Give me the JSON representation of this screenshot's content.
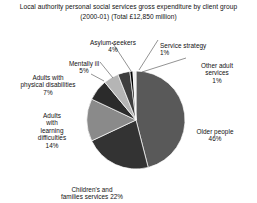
{
  "chart_data": {
    "type": "pie",
    "title": "Local authority personal social services gross expenditure by client group",
    "subtitle": "(2000-01) (Total £12,850 million)",
    "units": "percent of total gross expenditure",
    "total_label": "Total £12,850 million",
    "period": "2000-01",
    "legend": "none",
    "grid": false,
    "start_angle_deg": -90,
    "direction": "clockwise",
    "categories": [
      "Older people",
      "Children's and families services",
      "Adults with learning difficulties",
      "Adults with physical disabilities",
      "Mentally ill",
      "Asylum-seekers",
      "Service strategy",
      "Other adult services"
    ],
    "values": [
      46,
      22,
      14,
      7,
      5,
      4,
      1,
      1
    ],
    "slices": [
      {
        "label": "Older people",
        "value": 46,
        "pct_text": "46%",
        "color": "#595959"
      },
      {
        "label": "Children's and families services",
        "value": 22,
        "pct_text": "22%",
        "color": "#333333"
      },
      {
        "label": "Adults with learning difficulties",
        "value": 14,
        "pct_text": "14%",
        "color": "#8a8a8a"
      },
      {
        "label": "Adults with physical disabilities",
        "value": 7,
        "pct_text": "7%",
        "color": "#2b2b2b"
      },
      {
        "label": "Mentally ill",
        "value": 5,
        "pct_text": "5%",
        "color": "#b5b5b5"
      },
      {
        "label": "Asylum-seekers",
        "value": 4,
        "pct_text": "4%",
        "color": "#3d3d3d"
      },
      {
        "label": "Service strategy",
        "value": 1,
        "pct_text": "1%",
        "color": "#000000"
      },
      {
        "label": "Other adult services",
        "value": 1,
        "pct_text": "1%",
        "color": "#ededed"
      }
    ]
  },
  "labels": {
    "asylum": {
      "name": "Asylum-seekers",
      "pct": "4%"
    },
    "service": {
      "name": "Service strategy",
      "pct": "1%"
    },
    "otheradult": {
      "name": "Other adult\nservices",
      "pct": "1%"
    },
    "mental": {
      "name": "Mentally ill",
      "pct": "5%"
    },
    "physical": {
      "name": "Adults with\nphysical disabilities",
      "pct": "7%"
    },
    "learning": {
      "name": "Adults\nwith\nlearning\ndifficulties",
      "pct": "14%"
    },
    "children": {
      "name": "Children's and\nfamilies services 22%",
      "pct": ""
    },
    "older": {
      "name": "Older people",
      "pct": "46%"
    }
  },
  "style": {
    "background": "#ffffff",
    "text_color": "#111111",
    "slice_stroke": "#ffffff",
    "leader_color": "#4a4a4a"
  },
  "geometry": {
    "cx": 136,
    "cy": 120,
    "r": 49
  }
}
